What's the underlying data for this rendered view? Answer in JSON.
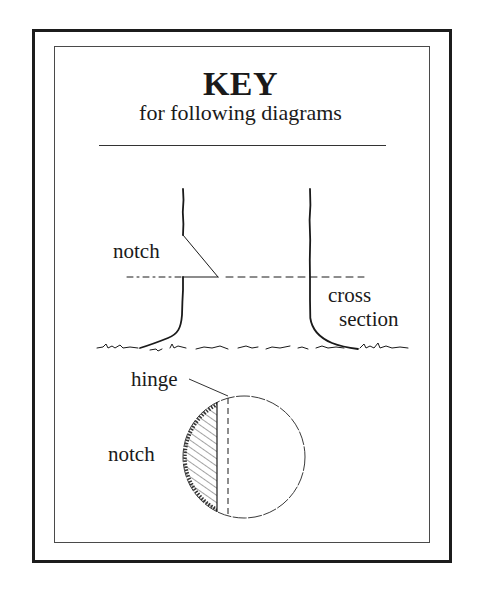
{
  "header": {
    "title": "KEY",
    "subtitle": "for following diagrams"
  },
  "tree_diagram": {
    "notch_label": "notch",
    "cross_section_label_line1": "cross",
    "cross_section_label_line2": "section"
  },
  "cross_section_diagram": {
    "hinge_label": "hinge",
    "notch_label": "notch"
  },
  "colors": {
    "ink": "#1a1a1a",
    "background": "#ffffff"
  }
}
